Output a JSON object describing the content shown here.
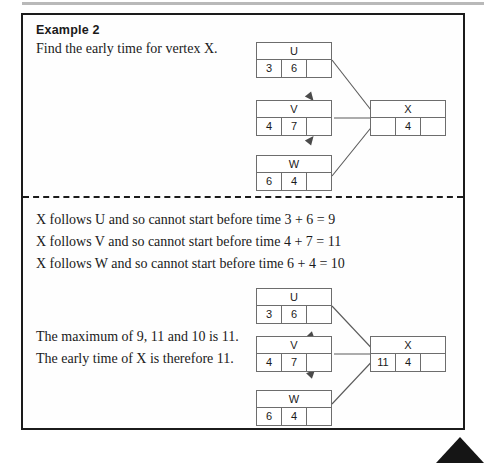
{
  "page": {
    "title": "Example 2",
    "prompt": "Find the early time for vertex X."
  },
  "reasoning_lines": [
    "X follows U and so cannot start before time  3 + 6 = 9",
    "X follows V and so cannot start before time  4 + 7 = 11",
    "X follows W and so cannot start before time 6 + 4 = 10"
  ],
  "conclusion_lines": [
    "The maximum of 9, 11 and 10 is 11.",
    "The early time of X is therefore 11."
  ],
  "upper_diagram": {
    "nodes": [
      {
        "label": "U",
        "cells": [
          "3",
          "6",
          ""
        ]
      },
      {
        "label": "V",
        "cells": [
          "4",
          "7",
          ""
        ]
      },
      {
        "label": "W",
        "cells": [
          "6",
          "4",
          ""
        ]
      },
      {
        "label": "X",
        "cells": [
          "",
          "4",
          ""
        ]
      }
    ]
  },
  "lower_diagram": {
    "nodes": [
      {
        "label": "U",
        "cells": [
          "3",
          "6",
          ""
        ]
      },
      {
        "label": "V",
        "cells": [
          "4",
          "7",
          ""
        ]
      },
      {
        "label": "W",
        "cells": [
          "6",
          "4",
          ""
        ]
      },
      {
        "label": "X",
        "cells": [
          "11",
          "4",
          ""
        ]
      }
    ]
  },
  "colors": {
    "frame": "#1b1b1b",
    "node_border": "#6d6d6d",
    "arrow": "#5a5a5a",
    "scan_bar": "#b9b9b9",
    "corner_mark": "#151515"
  }
}
